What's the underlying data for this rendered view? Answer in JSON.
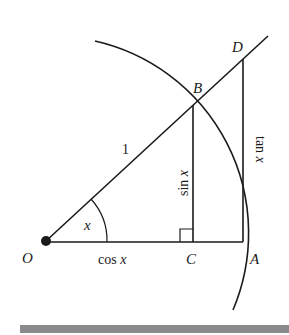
{
  "points": {
    "O": "O",
    "A": "A",
    "B": "B",
    "C": "C",
    "D": "D"
  },
  "labels": {
    "radius": "1",
    "angle": "x",
    "sin_fn": "sin",
    "cos_fn": "cos",
    "tan_fn": "tan",
    "var": "x"
  },
  "colors": {
    "ink": "#1a1a1a",
    "bar": "#8a8a8a"
  }
}
